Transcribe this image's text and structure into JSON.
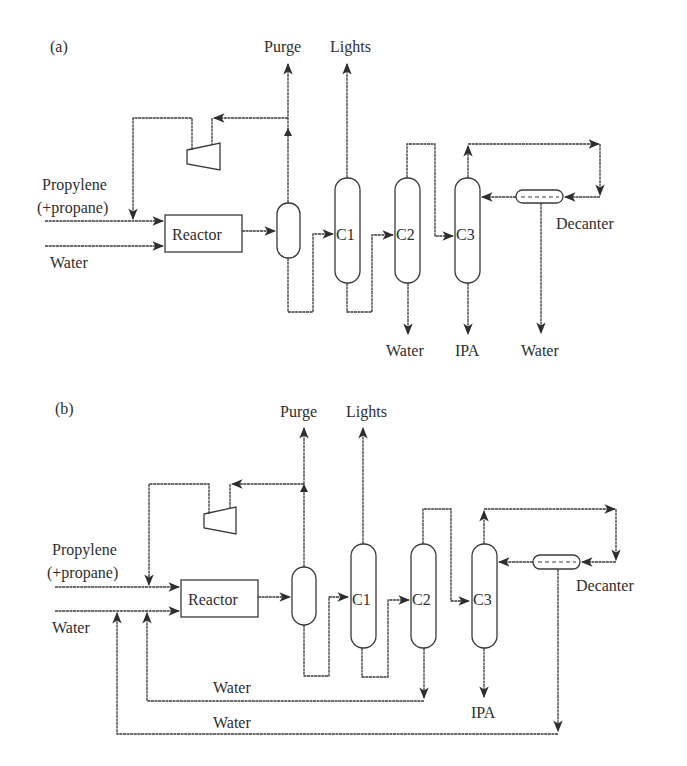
{
  "figure": {
    "panels": [
      {
        "id": "a",
        "label": "(a)",
        "inputs": {
          "feed1": "Propylene",
          "feed1_sub": "(+propane)",
          "feed2": "Water"
        },
        "units": {
          "reactor": "Reactor",
          "c1": "C1",
          "c2": "C2",
          "c3": "C3",
          "decanter": "Decanter"
        },
        "outputs": {
          "purge": "Purge",
          "lights": "Lights",
          "c2_bottom": "Water",
          "c3_bottom": "IPA",
          "decanter_bottom": "Water"
        }
      },
      {
        "id": "b",
        "label": "(b)",
        "inputs": {
          "feed1": "Propylene",
          "feed1_sub": "(+propane)",
          "feed2": "Water"
        },
        "units": {
          "reactor": "Reactor",
          "c1": "C1",
          "c2": "C2",
          "c3": "C3",
          "decanter": "Decanter"
        },
        "outputs": {
          "purge": "Purge",
          "lights": "Lights",
          "c3_bottom": "IPA"
        },
        "recycles": {
          "c2_water": "Water",
          "decanter_water": "Water"
        }
      }
    ],
    "colors": {
      "line": "#3a3a3a",
      "text": "#2e2e2e",
      "background": "#ffffff"
    }
  }
}
